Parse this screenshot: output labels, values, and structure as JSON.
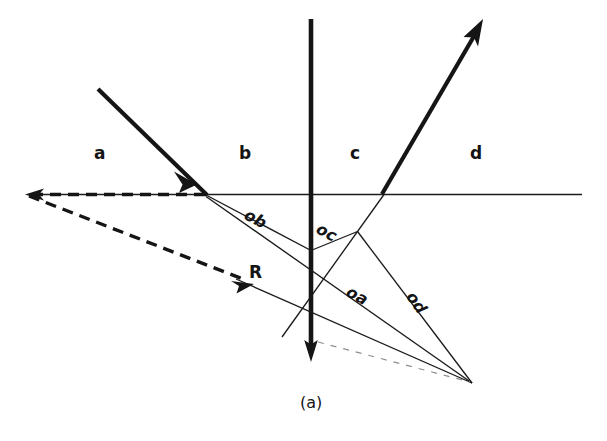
{
  "figure": {
    "caption": "(a)",
    "background_color": "#ffffff",
    "ink_color": "#151515",
    "width": 607,
    "height": 441
  },
  "regions": [
    {
      "id": "a",
      "label": "a",
      "x": 94,
      "y": 143
    },
    {
      "id": "b",
      "label": "b",
      "x": 239,
      "y": 143
    },
    {
      "id": "c",
      "label": "c",
      "x": 350,
      "y": 143
    },
    {
      "id": "d",
      "label": "d",
      "x": 470,
      "y": 143
    }
  ],
  "vectors": [
    {
      "id": "oa",
      "label": "oa",
      "x": 352,
      "y": 282,
      "rotation": 28
    },
    {
      "id": "ob",
      "label": "ob",
      "x": 250,
      "y": 205,
      "rotation": 28
    },
    {
      "id": "oc",
      "label": "oc",
      "x": 322,
      "y": 219,
      "rotation": 28
    },
    {
      "id": "od",
      "label": "od",
      "x": 418,
      "y": 288,
      "rotation": 55
    }
  ],
  "ray_labels": [
    {
      "id": "R",
      "label": "R",
      "x": 249,
      "y": 262
    }
  ],
  "geometry": {
    "interface_line": {
      "x1": 32,
      "y1": 194,
      "x2": 582,
      "y2": 194
    },
    "normal_line": {
      "x1": 311,
      "y1": 19,
      "x2": 311,
      "y2": 352
    },
    "incident_ray": {
      "x1": 98,
      "y1": 90,
      "x2": 207,
      "y2": 195
    },
    "emergent_ray": {
      "x1": 382,
      "y1": 194,
      "x2": 481,
      "y2": 24
    },
    "reflected_dashed_ray": {
      "x1": 207,
      "y1": 195,
      "x2": 250,
      "y2": 283
    },
    "backward_dashed_ray": {
      "x1": 207,
      "y1": 195,
      "x2": 26,
      "y2": 194
    },
    "origin_point": {
      "x": 472,
      "y": 383
    },
    "refraction_point": {
      "x": 207,
      "y": 195
    },
    "exit_point": {
      "x": 382,
      "y": 194
    },
    "ob_tip": {
      "x": 311,
      "y": 250
    },
    "oc_tip": {
      "x": 357,
      "y": 232
    },
    "oa_tip": {
      "x": 311,
      "y": 313
    }
  },
  "icons": {
    "incident_arrow": "arrowhead-down-right-icon",
    "emergent_arrow": "arrowhead-up-right-icon",
    "normal_arrow": "arrowhead-down-icon",
    "reflected_arrow": "arrowhead-down-right-icon",
    "backward_arrow": "arrowhead-left-icon"
  }
}
